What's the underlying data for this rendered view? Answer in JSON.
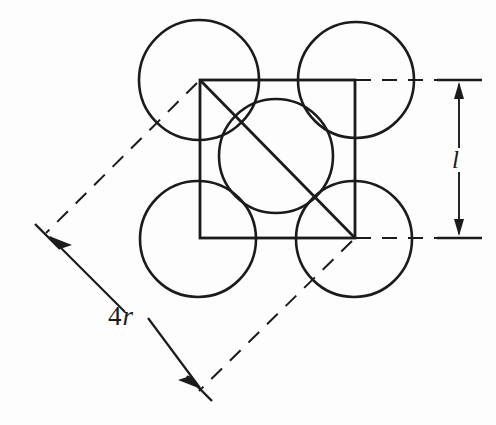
{
  "figure": {
    "kind": "crystal-unit-cell-packing-diagram",
    "background_color": "#fdfdfd",
    "stroke_color": "#1b1b1b",
    "canvas": {
      "width": 496,
      "height": 425
    },
    "labels": {
      "edge_length": "l",
      "edge_length_parts": {
        "prefix": "",
        "symbol": "l"
      },
      "diagonal_length": "4r",
      "diagonal_number": "4",
      "diagonal_symbol": "r"
    },
    "geometry": {
      "square": {
        "x": 200,
        "y": 80,
        "width": 155,
        "height": 158
      },
      "corner_circle_radius": 59,
      "center_circle_radius": 57,
      "circles": [
        {
          "name": "top-left-atom",
          "cx": 199,
          "cy": 80,
          "r": 60
        },
        {
          "name": "top-right-atom",
          "cx": 356,
          "cy": 80,
          "r": 58
        },
        {
          "name": "bottom-left-atom",
          "cx": 198,
          "cy": 239,
          "r": 58
        },
        {
          "name": "bottom-right-atom",
          "cx": 354,
          "cy": 239,
          "r": 58
        },
        {
          "name": "center-atom",
          "cx": 276,
          "cy": 156,
          "r": 57
        }
      ],
      "diagonal_line": {
        "x1": 200,
        "y1": 80,
        "x2": 355,
        "y2": 238
      },
      "dashed_extension_upper": {
        "x1": 196,
        "y1": 84,
        "x2": 46,
        "y2": 232
      },
      "dashed_extension_lower": {
        "x1": 351,
        "y1": 242,
        "x2": 198,
        "y2": 392
      },
      "dimension_line_4r": {
        "x1": 52,
        "y1": 239,
        "x2": 203,
        "y2": 389
      },
      "dimension_line_l": {
        "x": 459,
        "y1": 81,
        "y2": 239
      },
      "horizontal_leader_top": {
        "x1": 355,
        "y": 80,
        "x2": 474
      },
      "horizontal_leader_bottom": {
        "x1": 355,
        "y": 238,
        "x2": 474
      }
    }
  }
}
